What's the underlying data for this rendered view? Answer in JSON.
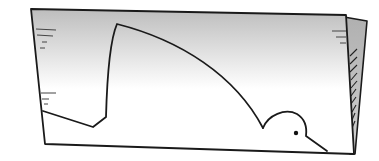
{
  "illustration": {
    "description": "Hand-drawn sketch of a sheet of paper with a curved shark-fin shape ending in a small bird head, a second sheet folded behind on the right",
    "subject_icons": [
      "paper-sheet-icon",
      "shark-fin-icon",
      "bird-head-icon"
    ],
    "colors": {
      "stroke": "#1a1a1a",
      "gradient_top": "#bdbdbd",
      "gradient_bottom": "#ffffff",
      "back_sheet": "#b8b8b8",
      "background": "#ffffff"
    }
  }
}
